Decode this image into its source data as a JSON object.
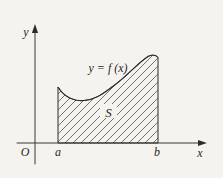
{
  "figure": {
    "curve_label": "y = f (x)",
    "region_label": "S",
    "y_axis_label": "y",
    "x_axis_label": "x",
    "origin_label": "O",
    "interval_start_label": "a",
    "interval_end_label": "b"
  },
  "colors": {
    "background": "#f5f3f0",
    "line": "#2e2c29",
    "hatch": "#55524d"
  }
}
